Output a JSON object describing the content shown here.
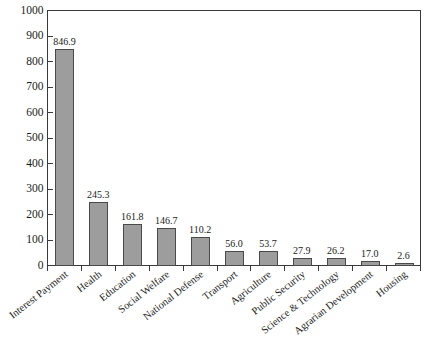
{
  "chart_data": {
    "type": "bar",
    "title": "",
    "subtitle": "",
    "xlabel": "",
    "ylabel": "",
    "ylim": [
      0,
      1000
    ],
    "ytick_labels": [
      "0",
      "100",
      "200",
      "300",
      "400",
      "500",
      "600",
      "700",
      "800",
      "900",
      "1000"
    ],
    "yticks": [
      0,
      100,
      200,
      300,
      400,
      500,
      600,
      700,
      800,
      900,
      1000
    ],
    "grid": false,
    "legend": false,
    "legend_position": "none",
    "bar_color": "#9d9d9d",
    "bar_edge_color": "#4a4a4a",
    "axis_color": "#3a3a3a",
    "categories": [
      "Interest Payment",
      "Health",
      "Education",
      "Social Welfare",
      "National Defense",
      "Transport",
      "Agriculture",
      "Public Security",
      "Science & Technology",
      "Agrarian Development",
      "Housing"
    ],
    "values": [
      846.9,
      245.3,
      161.8,
      146.7,
      110.2,
      56.0,
      53.7,
      27.9,
      26.2,
      17.0,
      2.6
    ],
    "data_labels": [
      "846.9",
      "245.3",
      "161.8",
      "146.7",
      "110.2",
      "56.0",
      "53.7",
      "27.9",
      "26.2",
      "17.0",
      "2.6"
    ]
  }
}
